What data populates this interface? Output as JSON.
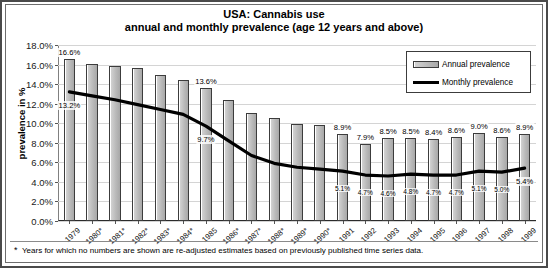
{
  "chart_data": {
    "type": "bar",
    "title": "USA: Cannabis use",
    "subtitle": "annual and monthly prevalence (age 12 years and above)",
    "xlabel": "",
    "ylabel": "prevalence in %",
    "ylim": [
      0,
      18
    ],
    "ytick_step": 2,
    "ytick_labels": [
      "0.0%",
      "2.0%",
      "4.0%",
      "6.0%",
      "8.0%",
      "10.0%",
      "12.0%",
      "14.0%",
      "16.0%",
      "18.0%"
    ],
    "grid": true,
    "legend_position": "top-right",
    "categories": [
      "1979",
      "1980*",
      "1981*",
      "1982*",
      "1983*",
      "1984*",
      "1985",
      "1986*",
      "1987*",
      "1988*",
      "1989*",
      "1990*",
      "1991",
      "1992",
      "1993",
      "1994",
      "1995",
      "1996",
      "1997",
      "1998",
      "1999"
    ],
    "series": [
      {
        "name": "Annual prevalence",
        "type": "bar",
        "values": [
          16.6,
          16.1,
          15.9,
          15.7,
          14.9,
          14.4,
          13.6,
          12.4,
          11.0,
          10.5,
          9.9,
          9.8,
          8.9,
          7.9,
          8.5,
          8.5,
          8.4,
          8.6,
          9.0,
          8.6,
          8.9
        ],
        "labels": [
          "16.6%",
          "",
          "",
          "",
          "",
          "",
          "13.6%",
          "",
          "",
          "",
          "",
          "",
          "8.9%",
          "7.9%",
          "8.5%",
          "8.5%",
          "8.4%",
          "8.6%",
          "9.0%",
          "8.6%",
          "8.9%"
        ]
      },
      {
        "name": "Monthly prevalence",
        "type": "line",
        "values": [
          13.2,
          12.8,
          12.4,
          11.9,
          11.4,
          10.9,
          9.7,
          8.2,
          6.7,
          5.9,
          5.5,
          5.3,
          5.1,
          4.7,
          4.6,
          4.8,
          4.7,
          4.7,
          5.1,
          5.0,
          5.4
        ],
        "labels": [
          "13.2%",
          "",
          "",
          "",
          "",
          "",
          "9.7%",
          "",
          "",
          "",
          "",
          "",
          "5.1%",
          "4.7%",
          "4.6%",
          "4.8%",
          "4.7%",
          "4.7%",
          "5.1%",
          "5.0%",
          "5.4%"
        ]
      }
    ]
  },
  "footnote": {
    "marker": "*",
    "text": "Years for which no numbers are shown are re-adjusted estimates based on previously published time series data."
  }
}
